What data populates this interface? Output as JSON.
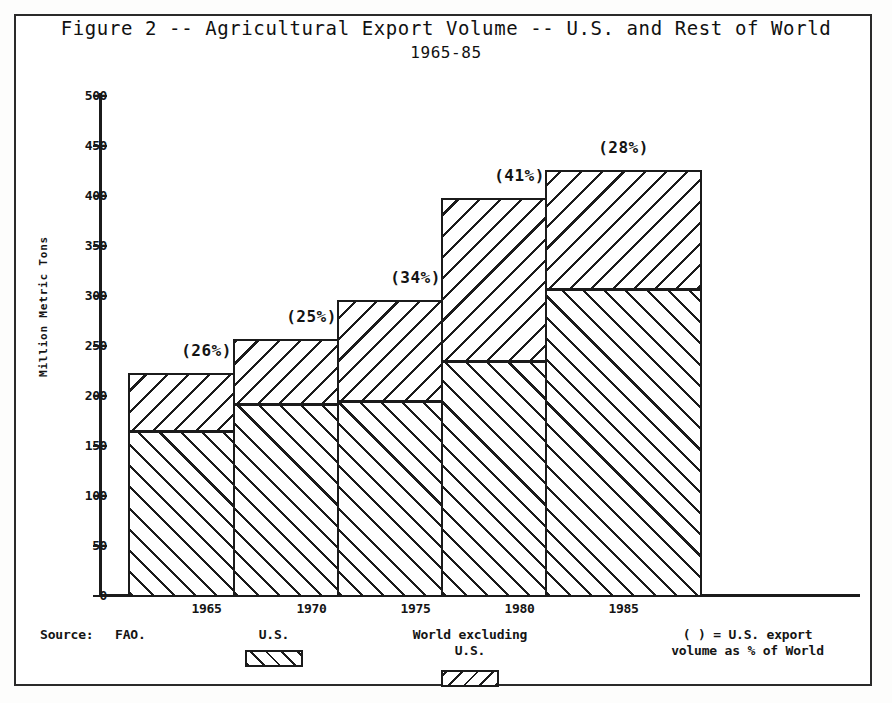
{
  "figure": {
    "title_line1": "Figure 2 -- Agricultural Export Volume -- U.S. and Rest of World",
    "title_line2": "1965-85"
  },
  "footer": {
    "source_label": "Source:",
    "source_value": "FAO.",
    "legend_us": "U.S.",
    "legend_world": "World excluding\nU.S.",
    "legend_note": "( ) = U.S. export\nvolume as % of World",
    "swatch_us_name": "us-hatch-swatch",
    "swatch_world_name": "world-hatch-swatch"
  },
  "chart_data": {
    "type": "bar",
    "subtype": "stacked",
    "title": "Figure 2 -- Agricultural Export Volume -- U.S. and Rest of World 1965-85",
    "xlabel": "",
    "ylabel": "Million Metric Tons",
    "ylim": [
      0,
      500
    ],
    "yticks": [
      0,
      50,
      100,
      150,
      200,
      250,
      300,
      350,
      400,
      450,
      500
    ],
    "ytick_labels": [
      "0",
      "50",
      "100",
      "150",
      "200",
      "250",
      "300",
      "350",
      "400",
      "450",
      "500"
    ],
    "grid": false,
    "legend_position": "below-axis",
    "categories": [
      "1965",
      "1970",
      "1975",
      "1980",
      "1985"
    ],
    "series": [
      {
        "name": "U.S.",
        "values": [
          165,
          192,
          195,
          235,
          307
        ]
      },
      {
        "name": "World excluding U.S.",
        "values": [
          57,
          64,
          100,
          162,
          118
        ]
      }
    ],
    "totals": [
      222,
      256,
      295,
      397,
      425
    ],
    "annotations": [
      "(26%)",
      "(25%)",
      "(34%)",
      "(41%)",
      "(28%)"
    ],
    "annotation_meaning": "( ) = U.S. export volume as % of World",
    "source": "FAO."
  },
  "axis": {
    "y_title": "Million Metric Tons"
  }
}
